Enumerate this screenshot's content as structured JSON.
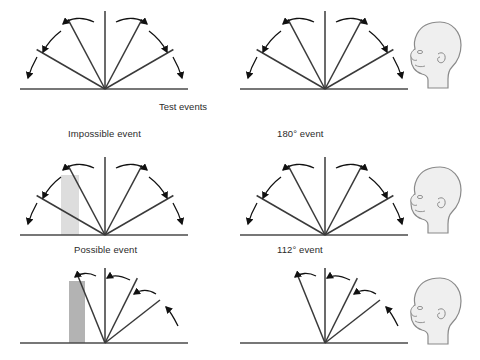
{
  "figure": {
    "title_visible": false,
    "background_color": "#ffffff",
    "line_color": "#3a3a3a",
    "ground_color": "#4a4a4a",
    "arrow_color": "#111111",
    "head_fill": "#efefef",
    "head_stroke": "#8a8a8a",
    "box_opaque_color": "#b3b3b3",
    "box_translucent_color": "#dddddd"
  },
  "section_labels": {
    "test_events": "Test events"
  },
  "panels": [
    {
      "id": "habituation-left",
      "row": 0,
      "column": 0,
      "label": "",
      "event_type": "habituation",
      "rotation_degrees": 180,
      "fan_line_angles": [
        30,
        62,
        90,
        118,
        150
      ],
      "arrow_count": 4,
      "box": null
    },
    {
      "id": "habituation-right",
      "row": 0,
      "column": 1,
      "label": "",
      "event_type": "habituation",
      "rotation_degrees": 180,
      "fan_line_angles": [
        30,
        62,
        90,
        118,
        150
      ],
      "arrow_count": 4,
      "box": null
    },
    {
      "id": "impossible-event",
      "row": 1,
      "column": 0,
      "label": "Impossible event",
      "event_type": "test",
      "rotation_degrees": 180,
      "fan_line_angles": [
        30,
        62,
        90,
        118,
        150
      ],
      "arrow_count": 4,
      "box": {
        "style": "translucent",
        "color": "#dddddd",
        "description": "box-passed-through"
      }
    },
    {
      "id": "180-degree-event",
      "row": 1,
      "column": 1,
      "label": "180° event",
      "event_type": "test",
      "rotation_degrees": 180,
      "fan_line_angles": [
        30,
        62,
        90,
        118,
        150
      ],
      "arrow_count": 4,
      "box": null
    },
    {
      "id": "possible-event",
      "row": 2,
      "column": 0,
      "label": "Possible event",
      "event_type": "test",
      "rotation_degrees": 112,
      "fan_line_angles": [
        38,
        62,
        90,
        112
      ],
      "arrow_count": 4,
      "box": {
        "style": "opaque",
        "color": "#b3b3b3",
        "description": "box-blocks-rotation"
      }
    },
    {
      "id": "112-degree-event",
      "row": 2,
      "column": 1,
      "label": "112° event",
      "event_type": "test",
      "rotation_degrees": 112,
      "fan_line_angles": [
        38,
        62,
        90,
        112
      ],
      "arrow_count": 4,
      "box": null
    }
  ],
  "infant_heads": [
    {
      "id": "infant-head-row-0",
      "row": 0,
      "facing": "left"
    },
    {
      "id": "infant-head-row-1",
      "row": 1,
      "facing": "left"
    },
    {
      "id": "infant-head-row-2",
      "row": 2,
      "facing": "left"
    }
  ]
}
